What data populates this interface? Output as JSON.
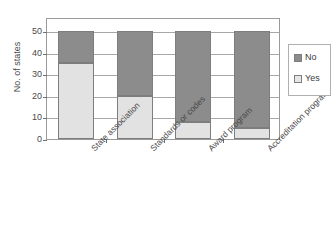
{
  "chart_data": {
    "type": "bar",
    "stacked": true,
    "title": "",
    "xlabel": "",
    "ylabel": "No. of states",
    "ylim": [
      0,
      50
    ],
    "yticks": [
      0,
      10,
      20,
      30,
      40,
      50
    ],
    "ytick_labels": [
      "0",
      "10",
      "20",
      "30",
      "40",
      "50"
    ],
    "grid": true,
    "legend_position": "right",
    "categories": [
      "State association",
      "Standards or codes",
      "Award program",
      "Accreditation program"
    ],
    "series": [
      {
        "name": "Yes",
        "color": "#e2e2e2",
        "values": [
          35,
          20,
          8,
          5
        ]
      },
      {
        "name": "No",
        "color": "#8c8c8c",
        "values": [
          15,
          30,
          42,
          45
        ]
      }
    ],
    "legend_entries": [
      {
        "label": "No",
        "color": "#8c8c8c"
      },
      {
        "label": "Yes",
        "color": "#e6e6e6"
      }
    ]
  },
  "colors": {
    "series_no": "#8c8c8c",
    "series_yes": "#e2e2e2",
    "axis": "#9a9a9a",
    "gridline": "#a8a8a8",
    "text": "#4a4a4a",
    "background": "#ffffff"
  }
}
